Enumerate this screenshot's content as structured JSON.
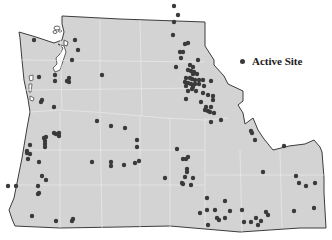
{
  "map": {
    "region": "Pacific Northwest (Washington, Oregon, Idaho)",
    "land_color": "#d3d3d3",
    "border_color": "#3c3c3c",
    "internal_line_color": "#f0f0f0",
    "site_color": "#3a3a3a"
  },
  "legend": {
    "items": [
      {
        "label": "Active Site",
        "symbol": "filled-circle"
      }
    ]
  },
  "sites": [
    [
      34,
      40
    ],
    [
      75,
      40
    ],
    [
      78,
      50
    ],
    [
      72,
      60
    ],
    [
      55,
      75
    ],
    [
      39,
      77
    ],
    [
      69,
      78
    ],
    [
      102,
      75
    ],
    [
      55,
      81
    ],
    [
      69,
      82
    ],
    [
      42,
      100
    ],
    [
      41,
      102
    ],
    [
      54,
      107
    ],
    [
      97,
      121
    ],
    [
      54,
      133
    ],
    [
      59,
      133
    ],
    [
      56,
      134
    ],
    [
      44,
      138
    ],
    [
      46,
      137
    ],
    [
      59,
      136
    ],
    [
      45,
      141
    ],
    [
      45,
      144
    ],
    [
      45,
      147
    ],
    [
      92,
      162
    ],
    [
      111,
      162
    ],
    [
      111,
      166
    ],
    [
      39,
      162
    ],
    [
      30,
      154
    ],
    [
      28,
      159
    ],
    [
      30,
      145
    ],
    [
      42,
      176
    ],
    [
      38,
      186
    ],
    [
      46,
      180
    ],
    [
      38,
      194
    ],
    [
      39,
      193
    ],
    [
      32,
      216
    ],
    [
      56,
      221
    ],
    [
      73,
      219
    ],
    [
      72,
      221
    ],
    [
      174,
      6
    ],
    [
      178,
      15
    ],
    [
      174,
      22
    ],
    [
      173,
      35
    ],
    [
      185,
      44
    ],
    [
      188,
      43
    ],
    [
      180,
      52
    ],
    [
      183,
      52
    ],
    [
      181,
      58
    ],
    [
      198,
      60
    ],
    [
      176,
      67
    ],
    [
      190,
      65
    ],
    [
      193,
      67
    ],
    [
      191,
      71
    ],
    [
      194,
      72
    ],
    [
      188,
      70
    ],
    [
      193,
      74
    ],
    [
      197,
      74
    ],
    [
      186,
      78
    ],
    [
      190,
      78
    ],
    [
      192,
      79
    ],
    [
      195,
      80
    ],
    [
      199,
      80
    ],
    [
      203,
      80
    ],
    [
      185,
      82
    ],
    [
      188,
      83
    ],
    [
      191,
      84
    ],
    [
      195,
      84
    ],
    [
      199,
      84
    ],
    [
      204,
      86
    ],
    [
      211,
      81
    ],
    [
      186,
      86
    ],
    [
      193,
      87
    ],
    [
      192,
      89
    ],
    [
      188,
      91
    ],
    [
      196,
      91
    ],
    [
      203,
      93
    ],
    [
      208,
      95
    ],
    [
      213,
      96
    ],
    [
      186,
      99
    ],
    [
      201,
      102
    ],
    [
      213,
      100
    ],
    [
      206,
      107
    ],
    [
      211,
      107
    ],
    [
      205,
      110
    ],
    [
      208,
      111
    ],
    [
      210,
      112
    ],
    [
      214,
      113
    ],
    [
      221,
      120
    ],
    [
      211,
      122
    ],
    [
      251,
      131
    ],
    [
      252,
      133
    ],
    [
      255,
      140
    ],
    [
      177,
      149
    ],
    [
      183,
      159
    ],
    [
      186,
      159
    ],
    [
      188,
      157
    ],
    [
      187,
      169
    ],
    [
      187,
      172
    ],
    [
      185,
      177
    ],
    [
      193,
      178
    ],
    [
      182,
      183
    ],
    [
      183,
      184
    ],
    [
      191,
      185
    ],
    [
      207,
      198
    ],
    [
      225,
      201
    ],
    [
      242,
      210
    ],
    [
      284,
      146
    ],
    [
      263,
      172
    ],
    [
      296,
      176
    ],
    [
      299,
      183
    ],
    [
      306,
      186
    ],
    [
      315,
      183
    ],
    [
      200,
      213
    ],
    [
      207,
      210
    ],
    [
      208,
      225
    ],
    [
      215,
      210
    ],
    [
      217,
      218
    ],
    [
      219,
      220
    ],
    [
      230,
      211
    ],
    [
      244,
      222
    ],
    [
      251,
      222
    ],
    [
      256,
      218
    ],
    [
      258,
      225
    ],
    [
      261,
      221
    ],
    [
      266,
      212
    ],
    [
      268,
      215
    ],
    [
      294,
      211
    ],
    [
      314,
      208
    ],
    [
      225,
      218
    ],
    [
      124,
      165
    ],
    [
      137,
      147
    ],
    [
      137,
      140
    ],
    [
      139,
      161
    ],
    [
      135,
      163
    ],
    [
      165,
      178
    ],
    [
      16,
      186
    ],
    [
      8,
      186
    ],
    [
      111,
      126
    ],
    [
      125,
      128
    ],
    [
      67,
      81
    ],
    [
      27,
      151
    ],
    [
      27,
      153
    ]
  ]
}
